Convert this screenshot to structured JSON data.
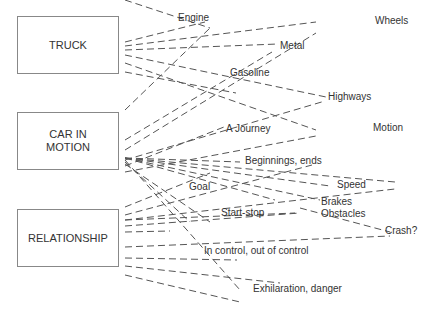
{
  "diagram": {
    "sources": [
      {
        "id": "truck",
        "label": "TRUCK"
      },
      {
        "id": "car",
        "label": "CAR IN\nMOTION"
      },
      {
        "id": "relationship",
        "label": "RELATIONSHIP"
      }
    ],
    "targets": [
      {
        "id": "engine",
        "label": "Engine"
      },
      {
        "id": "wheels",
        "label": "Wheels"
      },
      {
        "id": "metal",
        "label": "Metal"
      },
      {
        "id": "gasoline",
        "label": "Gasoline"
      },
      {
        "id": "highways",
        "label": "Highways"
      },
      {
        "id": "motion",
        "label": "Motion"
      },
      {
        "id": "journey",
        "label": "A Journey"
      },
      {
        "id": "beginnings",
        "label": "Beginnings, ends"
      },
      {
        "id": "goal",
        "label": "Goal"
      },
      {
        "id": "speed",
        "label": "Speed"
      },
      {
        "id": "brakes",
        "label": "Brakes"
      },
      {
        "id": "startstop",
        "label": "Start-stop"
      },
      {
        "id": "obstacles",
        "label": "Obstacles"
      },
      {
        "id": "crash",
        "label": "Crash?"
      },
      {
        "id": "incontrol",
        "label": "In control, out of control"
      },
      {
        "id": "exhilaration",
        "label": "Exhilaration, danger"
      }
    ],
    "connector_style": "dashed",
    "line_color": "#555555"
  }
}
